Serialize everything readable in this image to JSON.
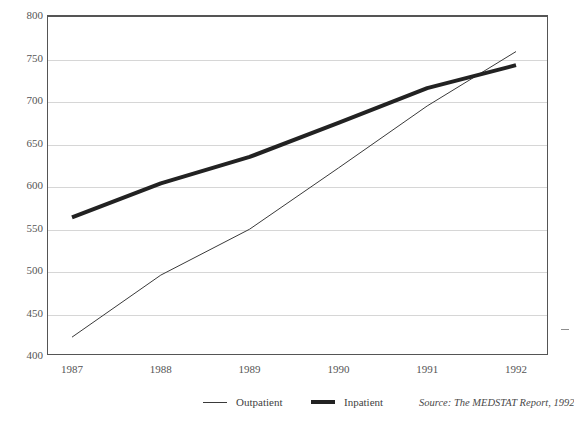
{
  "figure": {
    "title_partial": "",
    "background": "#ffffff",
    "frame_color": "#555555",
    "grid_color": "#d6d6d6"
  },
  "axes": {
    "y_ticks": [
      "800",
      "750",
      "700",
      "650",
      "600",
      "550",
      "500",
      "450",
      "400"
    ],
    "x_ticks": [
      "1987",
      "1988",
      "1989",
      "1990",
      "1991",
      "1992"
    ]
  },
  "legend": {
    "position": "bottom",
    "entries": [
      {
        "label": "Outpatient",
        "style": "thin",
        "color": "#3a3a3a"
      },
      {
        "label": "Inpatient",
        "style": "thick",
        "color": "#222222"
      }
    ]
  },
  "source": {
    "text": "Source: The MEDSTAT Report, 1992"
  },
  "chart_data": {
    "type": "line",
    "title": "",
    "subtitle": "",
    "xlabel": "",
    "ylabel": "",
    "x": [
      "1987",
      "1988",
      "1989",
      "1990",
      "1991",
      "1992"
    ],
    "xlim": [
      "1987",
      "1992"
    ],
    "ylim": [
      400,
      800
    ],
    "ytick_step": 50,
    "grid": "horizontal",
    "legend_position": "bottom",
    "series": [
      {
        "name": "Outpatient",
        "style": "thin",
        "color": "#3a3a3a",
        "linewidth": 1,
        "values": [
          421,
          494,
          548,
          620,
          693,
          757
        ]
      },
      {
        "name": "Inpatient",
        "style": "thick",
        "color": "#222222",
        "linewidth": 4,
        "values": [
          562,
          602,
          633,
          673,
          714,
          741
        ]
      }
    ],
    "annotations": [
      "Lines cross between 1991 and 1992"
    ]
  }
}
